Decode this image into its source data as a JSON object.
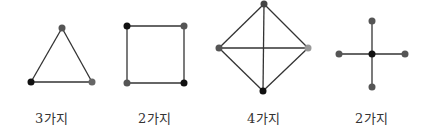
{
  "figures": [
    {
      "name": "triangle",
      "label": "3가지",
      "vertices": [
        {
          "x": 62,
          "y": 28,
          "color": "#555555"
        },
        {
          "x": 31,
          "y": 82,
          "color": "#111111"
        },
        {
          "x": 92,
          "y": 82,
          "color": "#666666"
        }
      ],
      "edges": [
        [
          0,
          1
        ],
        [
          1,
          2
        ],
        [
          2,
          0
        ]
      ]
    },
    {
      "name": "square",
      "label": "2가지",
      "vertices": [
        {
          "x": 127,
          "y": 26,
          "color": "#111111"
        },
        {
          "x": 184,
          "y": 26,
          "color": "#555555"
        },
        {
          "x": 184,
          "y": 83,
          "color": "#111111"
        },
        {
          "x": 127,
          "y": 83,
          "color": "#555555"
        }
      ],
      "edges": [
        [
          0,
          1
        ],
        [
          1,
          2
        ],
        [
          2,
          3
        ],
        [
          3,
          0
        ]
      ]
    },
    {
      "name": "diamond",
      "label": "4가지",
      "vertices": [
        {
          "x": 264,
          "y": 4,
          "color": "#444444"
        },
        {
          "x": 308,
          "y": 48,
          "color": "#999999"
        },
        {
          "x": 263,
          "y": 91,
          "color": "#111111"
        },
        {
          "x": 219,
          "y": 48,
          "color": "#555555"
        }
      ],
      "edges": [
        [
          0,
          1
        ],
        [
          1,
          2
        ],
        [
          2,
          3
        ],
        [
          3,
          0
        ],
        [
          0,
          2
        ],
        [
          1,
          3
        ]
      ]
    },
    {
      "name": "cross",
      "label": "2가지",
      "vertices": [
        {
          "x": 372,
          "y": 54,
          "color": "#111111"
        },
        {
          "x": 339,
          "y": 54,
          "color": "#555555"
        },
        {
          "x": 405,
          "y": 54,
          "color": "#555555"
        },
        {
          "x": 372,
          "y": 21,
          "color": "#555555"
        },
        {
          "x": 372,
          "y": 87,
          "color": "#555555"
        }
      ],
      "edges": [
        [
          0,
          1
        ],
        [
          0,
          2
        ],
        [
          0,
          3
        ],
        [
          0,
          4
        ]
      ]
    }
  ],
  "labels": {
    "triangle": "3가지",
    "square": "2가지",
    "diamond": "4가지",
    "cross": "2가지"
  },
  "style": {
    "edge_color": "#333333",
    "vertex_radius": 3.5
  }
}
